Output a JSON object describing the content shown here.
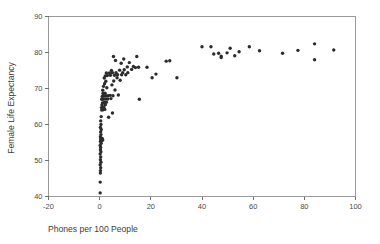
{
  "chart_data": {
    "type": "scatter",
    "title": "",
    "subtitle": "",
    "xlabel": "Phones per 100 People",
    "ylabel": "Female Life Expectancy",
    "xlim": [
      -20,
      100
    ],
    "ylim": [
      40,
      90
    ],
    "xticks": [
      -20,
      0,
      20,
      40,
      60,
      80,
      100
    ],
    "yticks": [
      40,
      50,
      60,
      70,
      80,
      90
    ],
    "xtick_labels": [
      "-20",
      "0",
      "20",
      "40",
      "60",
      "80",
      "100"
    ],
    "ytick_labels": [
      "40",
      "50",
      "60",
      "70",
      "80",
      "90"
    ],
    "grid": false,
    "legend": null,
    "legend_position": "none",
    "marker": {
      "shape": "circle",
      "size_px": 1.7,
      "color": "#2b2b2b"
    },
    "frame_color": "#9a9a9a",
    "background": "#ffffff",
    "series": [
      {
        "name": "Countries",
        "points": [
          [
            0.2,
            41.0
          ],
          [
            0.2,
            44.0
          ],
          [
            0.3,
            46.5
          ],
          [
            0.3,
            47.2
          ],
          [
            0.4,
            48.0
          ],
          [
            0.2,
            48.8
          ],
          [
            0.5,
            49.5
          ],
          [
            0.3,
            50.2
          ],
          [
            0.4,
            51.0
          ],
          [
            0.2,
            51.8
          ],
          [
            0.5,
            52.4
          ],
          [
            0.3,
            53.0
          ],
          [
            0.4,
            53.6
          ],
          [
            0.2,
            54.2
          ],
          [
            0.6,
            54.8
          ],
          [
            0.3,
            55.3
          ],
          [
            0.5,
            55.6
          ],
          [
            0.9,
            55.6
          ],
          [
            1.2,
            55.7
          ],
          [
            0.4,
            56.0
          ],
          [
            0.7,
            56.0
          ],
          [
            1.0,
            56.1
          ],
          [
            0.3,
            56.6
          ],
          [
            0.5,
            57.2
          ],
          [
            0.4,
            57.9
          ],
          [
            0.6,
            58.6
          ],
          [
            0.3,
            59.2
          ],
          [
            0.5,
            60.0
          ],
          [
            0.4,
            61.0
          ],
          [
            3.5,
            62.0
          ],
          [
            0.6,
            62.2
          ],
          [
            5.0,
            63.2
          ],
          [
            0.8,
            64.0
          ],
          [
            1.4,
            64.1
          ],
          [
            2.0,
            64.2
          ],
          [
            0.7,
            64.7
          ],
          [
            1.6,
            64.8
          ],
          [
            0.9,
            65.4
          ],
          [
            2.2,
            65.5
          ],
          [
            1.1,
            66.0
          ],
          [
            1.8,
            66.1
          ],
          [
            2.6,
            66.2
          ],
          [
            0.8,
            67.0
          ],
          [
            1.5,
            67.0
          ],
          [
            2.3,
            67.1
          ],
          [
            3.1,
            67.1
          ],
          [
            4.4,
            67.2
          ],
          [
            15.5,
            67.0
          ],
          [
            1.0,
            67.8
          ],
          [
            1.7,
            67.9
          ],
          [
            2.5,
            68.0
          ],
          [
            3.3,
            68.0
          ],
          [
            4.1,
            68.1
          ],
          [
            5.2,
            68.0
          ],
          [
            7.3,
            68.2
          ],
          [
            1.3,
            68.6
          ],
          [
            2.1,
            68.7
          ],
          [
            1.2,
            69.5
          ],
          [
            6.0,
            69.6
          ],
          [
            2.8,
            70.2
          ],
          [
            1.5,
            70.6
          ],
          [
            4.8,
            71.0
          ],
          [
            1.9,
            71.3
          ],
          [
            2.4,
            72.0
          ],
          [
            5.5,
            72.1
          ],
          [
            8.0,
            72.3
          ],
          [
            1.8,
            72.9
          ],
          [
            6.8,
            73.0
          ],
          [
            20.5,
            73.0
          ],
          [
            30.2,
            73.0
          ],
          [
            2.2,
            73.5
          ],
          [
            3.0,
            73.6
          ],
          [
            4.2,
            73.7
          ],
          [
            5.8,
            73.7
          ],
          [
            7.0,
            73.8
          ],
          [
            8.6,
            73.8
          ],
          [
            10.2,
            73.8
          ],
          [
            2.6,
            74.3
          ],
          [
            3.8,
            74.3
          ],
          [
            5.0,
            74.4
          ],
          [
            6.4,
            74.4
          ],
          [
            9.0,
            74.4
          ],
          [
            11.0,
            74.4
          ],
          [
            22.0,
            74.0
          ],
          [
            4.6,
            75.0
          ],
          [
            7.8,
            75.1
          ],
          [
            9.6,
            75.2
          ],
          [
            12.5,
            75.3
          ],
          [
            14.0,
            75.8
          ],
          [
            15.2,
            75.9
          ],
          [
            18.5,
            75.9
          ],
          [
            10.8,
            76.0
          ],
          [
            13.2,
            76.1
          ],
          [
            8.4,
            77.0
          ],
          [
            11.6,
            77.2
          ],
          [
            26.0,
            77.6
          ],
          [
            27.4,
            77.7
          ],
          [
            6.2,
            77.8
          ],
          [
            9.4,
            78.2
          ],
          [
            5.4,
            78.9
          ],
          [
            14.5,
            78.9
          ],
          [
            47.5,
            78.6
          ],
          [
            47.5,
            79.0
          ],
          [
            52.8,
            79.1
          ],
          [
            44.6,
            79.6
          ],
          [
            46.5,
            79.8
          ],
          [
            49.8,
            79.9
          ],
          [
            71.5,
            79.8
          ],
          [
            84.0,
            78.0
          ],
          [
            54.5,
            80.2
          ],
          [
            62.5,
            80.5
          ],
          [
            77.5,
            80.6
          ],
          [
            91.5,
            80.7
          ],
          [
            40.0,
            81.6
          ],
          [
            43.5,
            81.6
          ],
          [
            58.5,
            81.6
          ],
          [
            51.0,
            81.2
          ],
          [
            84.0,
            82.4
          ]
        ]
      }
    ]
  },
  "axes": {
    "x_title": "Phones per 100 People",
    "y_title": "Female Life Expectancy"
  }
}
